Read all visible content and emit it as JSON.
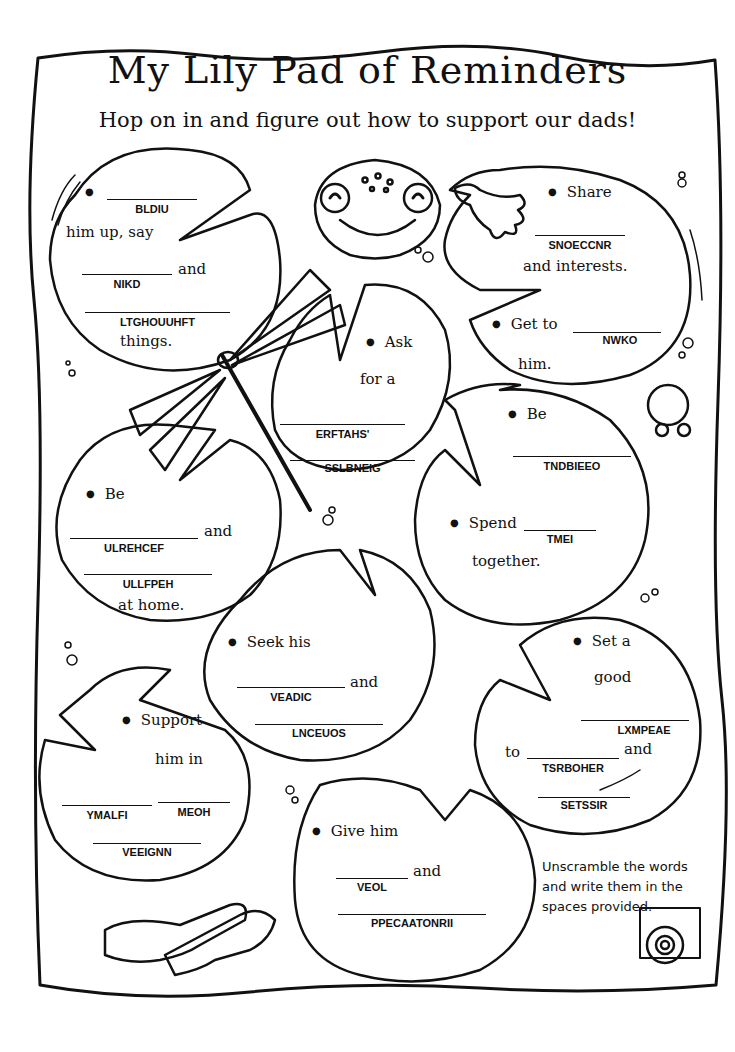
{
  "title": "My Lily Pad of Reminders",
  "subtitle": "Hop on in and figure out how to support our dads!",
  "pads": [
    {
      "id": "build",
      "lines": [
        "him up, say",
        "and",
        "things."
      ],
      "words": [
        "BLDIU",
        "NIKD",
        "LTGHOUUHFT"
      ]
    },
    {
      "id": "share",
      "lines": [
        "Share",
        "and interests."
      ],
      "words": [
        "SNOECCNR"
      ]
    },
    {
      "id": "get-to",
      "lines": [
        "Get to",
        "him."
      ],
      "words": [
        "NWKO"
      ]
    },
    {
      "id": "ask",
      "lines": [
        "Ask",
        "for a"
      ],
      "words": [
        "ERFTAHS'",
        "SSLBNEIG"
      ]
    },
    {
      "id": "be-obedient",
      "lines": [
        "Be"
      ],
      "words": [
        "TNDBIEEO"
      ]
    },
    {
      "id": "spend",
      "lines": [
        "Spend",
        "together."
      ],
      "words": [
        "TMEI"
      ]
    },
    {
      "id": "be-cheerful",
      "lines": [
        "Be",
        "and",
        "at home."
      ],
      "words": [
        "ULREHCEF",
        "ULLFPEH"
      ]
    },
    {
      "id": "seek",
      "lines": [
        "Seek his",
        "and"
      ],
      "words": [
        "VEADIC",
        "LNCEUOS"
      ]
    },
    {
      "id": "set-example",
      "lines": [
        "Set a",
        "good",
        "to",
        "and"
      ],
      "words": [
        "LXMPEAE",
        "TSRBOHER",
        "SETSSIR"
      ]
    },
    {
      "id": "support",
      "lines": [
        "Support",
        "him in"
      ],
      "words": [
        "YMALFI",
        "MEOH",
        "VEEIGNN"
      ]
    },
    {
      "id": "give",
      "lines": [
        "Give him",
        "and"
      ],
      "words": [
        "VEOL",
        "PPECAATONRII"
      ]
    }
  ],
  "instructions": "Unscramble the words and write them in the spaces provided."
}
